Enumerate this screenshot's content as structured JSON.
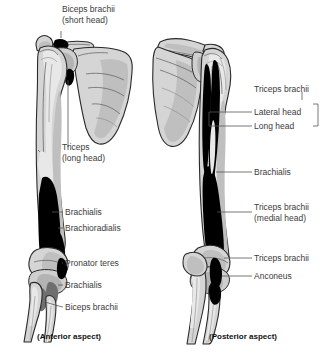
{
  "figure": {
    "title_caption_left": "(Anterior aspect)",
    "title_caption_right": "(Posterior aspect)",
    "colors": {
      "bone_fill": "#d5d5d5",
      "bone_shadow": "#bdbdbd",
      "bone_outline": "#2a2a2a",
      "muscle_attachment": "#000000",
      "muscle_attachment_gray": "#7a7a7a",
      "label_text": "#3b3b3b",
      "caption_text": "#111111",
      "leader_line": "#555555",
      "background": "#ffffff"
    }
  },
  "anterior": {
    "caption": "(Anterior aspect)",
    "labels": [
      {
        "id": "biceps-short-head",
        "line1": "Biceps brachii",
        "line2": "(short head)"
      },
      {
        "id": "triceps-long-head",
        "line1": "Triceps",
        "line2": "(long head)"
      },
      {
        "id": "brachialis-upper",
        "line1": "Brachialis",
        "line2": ""
      },
      {
        "id": "brachioradialis",
        "line1": "Brachioradialis",
        "line2": ""
      },
      {
        "id": "pronator-teres",
        "line1": "Pronator teres",
        "line2": ""
      },
      {
        "id": "brachialis-lower",
        "line1": "Brachialis",
        "line2": ""
      },
      {
        "id": "biceps-brachii",
        "line1": "Biceps brachii",
        "line2": ""
      }
    ]
  },
  "posterior": {
    "caption": "(Posterior aspect)",
    "labels": [
      {
        "id": "triceps-brachii-group",
        "line1": "Triceps brachii",
        "line2": ""
      },
      {
        "id": "lateral-head",
        "line1": "Lateral head",
        "line2": ""
      },
      {
        "id": "long-head",
        "line1": "Long head",
        "line2": ""
      },
      {
        "id": "brachialis",
        "line1": "Brachialis",
        "line2": ""
      },
      {
        "id": "triceps-medial-head",
        "line1": "Triceps brachii",
        "line2": "(medial head)"
      },
      {
        "id": "triceps-brachii-distal",
        "line1": "Triceps brachii",
        "line2": ""
      },
      {
        "id": "anconeus",
        "line1": "Anconeus",
        "line2": ""
      }
    ]
  }
}
